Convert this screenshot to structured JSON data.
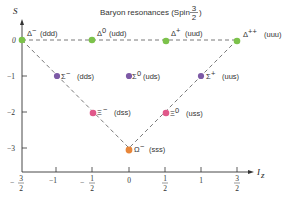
{
  "title": {
    "text": "Baryon resonances (Spin",
    "spin_num": "3",
    "spin_den": "2",
    "close": ")"
  },
  "axes": {
    "ylabel": "S",
    "xlabel_main": "I",
    "xlabel_sub": "z",
    "y_ticks": [
      {
        "label": "0",
        "value": 0
      },
      {
        "label": "−1",
        "value": -1
      },
      {
        "label": "−2",
        "value": -2
      },
      {
        "label": "−3",
        "value": -3
      }
    ],
    "x_ticks": [
      {
        "label": "−",
        "num": "3",
        "den": "2",
        "value": -1.5,
        "fraction": true
      },
      {
        "label": "−1",
        "value": -1,
        "fraction": false
      },
      {
        "label": "−",
        "num": "1",
        "den": "2",
        "value": -0.5,
        "fraction": true
      },
      {
        "label": "0",
        "value": 0,
        "fraction": false
      },
      {
        "label": "",
        "num": "1",
        "den": "2",
        "value": 0.5,
        "fraction": true
      },
      {
        "label": "1",
        "value": 1,
        "fraction": false
      },
      {
        "label": "",
        "num": "3",
        "den": "2",
        "value": 1.5,
        "fraction": true
      }
    ]
  },
  "particles": [
    {
      "symbol": "Δ",
      "charge": "−",
      "quarks": "(ddd)",
      "Iz": -1.5,
      "S": 0,
      "color": "#7cc24a"
    },
    {
      "symbol": "Δ",
      "charge": "0",
      "quarks": "(udd)",
      "Iz": -0.5,
      "S": 0,
      "color": "#7cc24a"
    },
    {
      "symbol": "Δ",
      "charge": "+",
      "quarks": "(uud)",
      "Iz": 0.5,
      "S": 0,
      "color": "#7cc24a"
    },
    {
      "symbol": "Δ",
      "charge": "++",
      "quarks": "(uuu)",
      "Iz": 1.5,
      "S": 0,
      "color": "#7cc24a"
    },
    {
      "symbol": "Σ",
      "charge": "−",
      "quarks": "(dds)",
      "Iz": -1,
      "S": -1,
      "color": "#7d5aa6"
    },
    {
      "symbol": "Σ",
      "charge": "0",
      "quarks": "(uds)",
      "Iz": 0,
      "S": -1,
      "color": "#7d5aa6"
    },
    {
      "symbol": "Σ",
      "charge": "+",
      "quarks": "(uus)",
      "Iz": 1,
      "S": -1,
      "color": "#7d5aa6"
    },
    {
      "symbol": "Ξ",
      "charge": "−",
      "quarks": "(dss)",
      "Iz": -0.5,
      "S": -2,
      "color": "#e0588a"
    },
    {
      "symbol": "Ξ",
      "charge": "0",
      "quarks": "(uss)",
      "Iz": 0.5,
      "S": -2,
      "color": "#e0588a"
    },
    {
      "symbol": "Ω",
      "charge": "−",
      "quarks": "(sss)",
      "Iz": 0,
      "S": -3,
      "color": "#e8863a"
    }
  ],
  "colors": {
    "delta": "#7cc24a",
    "sigma": "#7d5aa6",
    "xi": "#e0588a",
    "omega": "#e8863a",
    "axis": "#333333",
    "dashed": "#555555"
  }
}
